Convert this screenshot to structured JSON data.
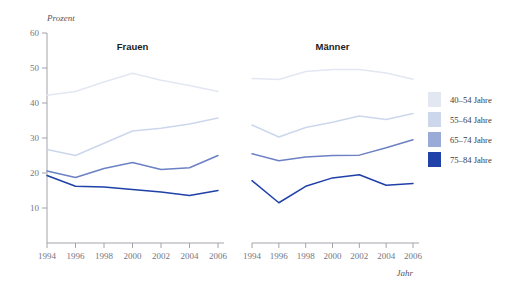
{
  "figure": {
    "top_artifact_text": "",
    "ylabel": "Prozent",
    "xlabel": "Jahr",
    "panels": [
      {
        "title": "Frauen"
      },
      {
        "title": "Männer"
      }
    ]
  },
  "legend": {
    "position": "right",
    "items": [
      {
        "label": "40–54 Jahre",
        "color": "#e3e7f2"
      },
      {
        "label": "55–64 Jahre",
        "color": "#cdd7ec"
      },
      {
        "label": "65–74 Jahre",
        "color": "#9aabd8"
      },
      {
        "label": "75–84 Jahre",
        "color": "#1f41a8"
      }
    ]
  },
  "chart_data": {
    "type": "line",
    "title": "",
    "subtitle": "",
    "xlabel": "Jahr",
    "ylabel": "Prozent",
    "ylim": [
      0,
      60
    ],
    "yticks": [
      10,
      20,
      30,
      40,
      50,
      60
    ],
    "ytick_labels": [
      "10",
      "20",
      "30",
      "40",
      "50",
      "60"
    ],
    "x": [
      1994,
      1996,
      1998,
      2000,
      2002,
      2004,
      2006
    ],
    "xtick_labels": [
      "1994",
      "1996",
      "1998",
      "2000",
      "2002",
      "2004",
      "2006"
    ],
    "xlim": [
      1994,
      2006
    ],
    "grid": false,
    "legend_position": "right",
    "panels": [
      {
        "name": "Frauen",
        "series": [
          {
            "name": "40–54 Jahre",
            "color": "#e3e7f2",
            "values": [
              42.2,
              43.3,
              46.0,
              48.5,
              46.5,
              45.0,
              43.3
            ]
          },
          {
            "name": "55–64 Jahre",
            "color": "#cdd7ec",
            "values": [
              26.7,
              25.0,
              28.5,
              32.0,
              32.8,
              34.0,
              35.7
            ]
          },
          {
            "name": "65–74 Jahre",
            "color": "#6c80c4",
            "values": [
              20.6,
              18.7,
              21.3,
              23.0,
              21.0,
              21.5,
              25.0
            ]
          },
          {
            "name": "75–84 Jahre",
            "color": "#1f41a8",
            "values": [
              19.3,
              16.2,
              16.0,
              15.3,
              14.6,
              13.6,
              15.0
            ]
          }
        ]
      },
      {
        "name": "Männer",
        "series": [
          {
            "name": "40–54 Jahre",
            "color": "#e3e7f2",
            "values": [
              47.0,
              46.7,
              49.0,
              49.6,
              49.6,
              48.6,
              46.8
            ]
          },
          {
            "name": "55–64 Jahre",
            "color": "#cdd7ec",
            "values": [
              33.7,
              30.3,
              33.0,
              34.5,
              36.3,
              35.3,
              37.0
            ]
          },
          {
            "name": "65–74 Jahre",
            "color": "#6c80c4",
            "values": [
              25.5,
              23.5,
              24.6,
              25.0,
              25.1,
              27.2,
              29.5
            ]
          },
          {
            "name": "75–84 Jahre",
            "color": "#1f41a8",
            "values": [
              17.8,
              11.5,
              16.2,
              18.6,
              19.5,
              16.5,
              17.0
            ]
          }
        ]
      }
    ]
  }
}
